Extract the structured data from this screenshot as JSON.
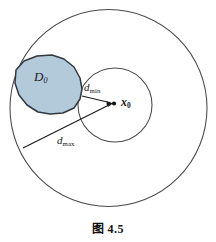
{
  "figure": {
    "caption_prefix": "图",
    "caption_number": "4.5",
    "background_color": "#ffffff",
    "stroke_color": "#3a3a3a"
  },
  "labels": {
    "region_label": "D",
    "region_subscript": "0",
    "dmin_label": "d",
    "dmin_subscript": "min",
    "dmax_label": "d",
    "dmax_subscript": "max",
    "center_label": "x",
    "center_subscript": "0"
  },
  "geometry": {
    "outer_circle": {
      "cx": 108.5,
      "cy": 108,
      "r": 98.5,
      "stroke": "#4a4a4a",
      "fill": "none"
    },
    "inner_circle": {
      "cx": 115,
      "cy": 105,
      "r": 37,
      "stroke": "#4a4a4a",
      "fill": "none"
    },
    "center_point": {
      "cx": 114,
      "cy": 103.5,
      "r": 2.1,
      "fill": "#111111"
    },
    "region_D0": {
      "fill": "#b3cadb",
      "stroke": "#33383d",
      "points": "37,56 52,55 64,59 74,67 80,78 82,89 80,99 74,108 63,113 50,114 38,112 27,105 19,95 15,83 16,70 24,61"
    },
    "arrow_dmin": {
      "x1": 82,
      "y1": 96,
      "x2": 112,
      "y2": 103,
      "stroke": "#1a1a1a"
    },
    "arrow_dmax": {
      "x1": 23,
      "y1": 148,
      "x2": 112,
      "y2": 104,
      "stroke": "#1a1a1a"
    }
  }
}
